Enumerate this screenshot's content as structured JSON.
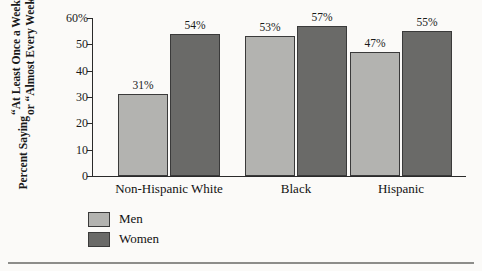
{
  "chart_data": {
    "type": "bar",
    "title": "",
    "subtitle": "",
    "xlabel": "",
    "ylabel": "Percent Saying “At Least Once a Week” or “Almost Every Week”",
    "ylabel_lines": [
      "Percent Saying",
      "“At Least Once a Week”",
      "or “Almost Every Week”"
    ],
    "categories": [
      "Non-Hispanic White",
      "Black",
      "Hispanic"
    ],
    "series": [
      {
        "name": "Men",
        "color": "#b3b3b0",
        "values": [
          31,
          53,
          47
        ],
        "labels": [
          "31%",
          "53%",
          "47%"
        ]
      },
      {
        "name": "Women",
        "color": "#6a6a68",
        "values": [
          54,
          57,
          55
        ],
        "labels": [
          "54%",
          "57%",
          "55%"
        ]
      }
    ],
    "ylim": [
      0,
      60
    ],
    "yticks": [
      0,
      10,
      20,
      30,
      40,
      50,
      60
    ],
    "ytick_labels": [
      "0",
      "10",
      "20",
      "30",
      "40",
      "50",
      "60%"
    ],
    "grid": false,
    "legend_position": "bottom-left",
    "value_labels_shown": true
  },
  "legend": {
    "items": [
      {
        "label": "Men",
        "color": "#b3b3b0"
      },
      {
        "label": "Women",
        "color": "#6a6a68"
      }
    ]
  },
  "colors": {
    "men": "#b3b3b0",
    "women": "#6a6a68",
    "axis": "#2a2a2a",
    "background": "#fbfaf8",
    "rule": "#8d8d8a"
  }
}
